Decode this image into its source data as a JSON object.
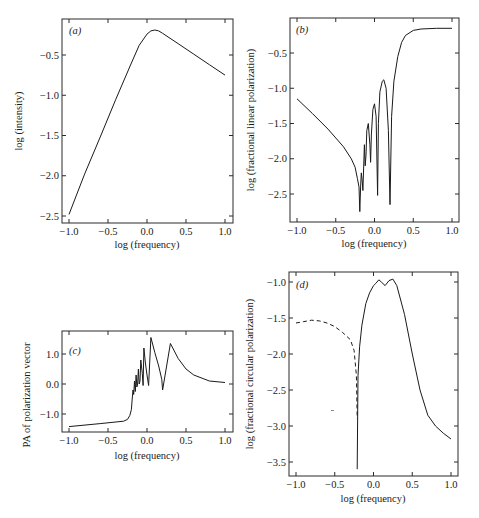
{
  "chart_data": [
    {
      "panel": "a",
      "type": "line",
      "label": "(a)",
      "title": "",
      "xlabel": "log (frequency)",
      "ylabel": "log (intensity)",
      "xlim": [
        -1.0,
        1.0
      ],
      "ylim": [
        -2.6,
        -0.15
      ],
      "xticks": [
        "-1.0",
        "-0.5",
        "0.0",
        "0.5",
        "1.0"
      ],
      "yticks": [
        "-0.5",
        "-1.0",
        "-1.5",
        "-2.0",
        "-2.5"
      ],
      "grid": false,
      "series": [
        {
          "name": "intensity",
          "style": "solid",
          "x": [
            -1.0,
            -0.8,
            -0.6,
            -0.4,
            -0.2,
            -0.1,
            0.0,
            0.05,
            0.1,
            0.15,
            0.2,
            0.4,
            0.6,
            0.8,
            1.0
          ],
          "y": [
            -2.48,
            -1.98,
            -1.52,
            -1.05,
            -0.6,
            -0.38,
            -0.24,
            -0.2,
            -0.19,
            -0.2,
            -0.23,
            -0.36,
            -0.49,
            -0.62,
            -0.75
          ]
        }
      ]
    },
    {
      "panel": "b",
      "type": "line",
      "label": "(b)",
      "title": "",
      "xlabel": "log (frequency)",
      "ylabel": "log (fractional linear polarization)",
      "xlim": [
        -1.0,
        1.0
      ],
      "ylim": [
        -2.85,
        -0.1
      ],
      "xticks": [
        "-1.0",
        "-0.5",
        "0.0",
        "0.5",
        "1.0"
      ],
      "yticks": [
        "-0.5",
        "-1.0",
        "-1.5",
        "-2.0",
        "-2.5"
      ],
      "grid": false,
      "series": [
        {
          "name": "linear polarization",
          "style": "solid",
          "x": [
            -1.0,
            -0.8,
            -0.6,
            -0.4,
            -0.3,
            -0.25,
            -0.22,
            -0.2,
            -0.19,
            -0.18,
            -0.17,
            -0.16,
            -0.15,
            -0.13,
            -0.12,
            -0.11,
            -0.1,
            -0.08,
            -0.06,
            -0.05,
            -0.04,
            -0.02,
            0.0,
            0.02,
            0.04,
            0.05,
            0.07,
            0.1,
            0.12,
            0.15,
            0.18,
            0.2,
            0.22,
            0.25,
            0.3,
            0.35,
            0.4,
            0.5,
            0.6,
            0.8,
            1.0
          ],
          "y": [
            -1.15,
            -1.36,
            -1.58,
            -1.83,
            -2.0,
            -2.12,
            -2.28,
            -2.4,
            -2.75,
            -2.4,
            -2.2,
            -2.3,
            -2.45,
            -1.8,
            -2.1,
            -1.95,
            -1.6,
            -1.5,
            -1.8,
            -2.05,
            -1.65,
            -1.3,
            -1.22,
            -1.4,
            -2.52,
            -1.5,
            -1.05,
            -0.9,
            -0.88,
            -1.0,
            -1.6,
            -2.65,
            -1.4,
            -0.9,
            -0.55,
            -0.35,
            -0.25,
            -0.18,
            -0.16,
            -0.15,
            -0.15
          ]
        }
      ]
    },
    {
      "panel": "c",
      "type": "line",
      "label": "(c)",
      "title": "",
      "xlabel": "log (frequency)",
      "ylabel": "PA of polarization vector",
      "xlim": [
        -1.0,
        1.0
      ],
      "ylim": [
        -1.55,
        1.75
      ],
      "xticks": [
        "-1.0",
        "-0.5",
        "0.0",
        "0.5",
        "1.0"
      ],
      "yticks": [
        "1.0",
        "0.0",
        "-1.0"
      ],
      "grid": false,
      "series": [
        {
          "name": "position angle",
          "style": "solid",
          "x": [
            -1.0,
            -0.6,
            -0.3,
            -0.25,
            -0.22,
            -0.2,
            -0.19,
            -0.18,
            -0.17,
            -0.16,
            -0.15,
            -0.14,
            -0.13,
            -0.12,
            -0.11,
            -0.1,
            -0.09,
            -0.08,
            -0.06,
            -0.05,
            -0.04,
            -0.02,
            0.0,
            0.02,
            0.05,
            0.1,
            0.15,
            0.19,
            0.2,
            0.3,
            0.4,
            0.5,
            0.6,
            0.8,
            1.0
          ],
          "y": [
            -1.42,
            -1.32,
            -1.24,
            -1.18,
            -1.05,
            -0.85,
            -0.5,
            -0.2,
            -0.35,
            0.1,
            -0.25,
            0.3,
            -0.1,
            0.0,
            0.5,
            0.0,
            0.1,
            0.8,
            0.35,
            -0.05,
            1.2,
            0.7,
            0.3,
            -0.05,
            1.55,
            1.05,
            0.6,
            0.15,
            -0.2,
            1.35,
            0.85,
            0.5,
            0.3,
            0.1,
            0.05
          ]
        }
      ]
    },
    {
      "panel": "d",
      "type": "line",
      "label": "(d)",
      "title": "",
      "xlabel": "log (frequency)",
      "ylabel": "log (fractional circular polarization)",
      "xlim": [
        -1.0,
        1.0
      ],
      "ylim": [
        -3.6,
        -0.85
      ],
      "xticks": [
        "-1.0",
        "-0.5",
        "0.0",
        "0.5",
        "1.0"
      ],
      "yticks": [
        "-1.0",
        "-1.5",
        "-2.0",
        "-2.5",
        "-3.0",
        "-3.5"
      ],
      "grid": false,
      "series": [
        {
          "name": "negative (dashed)",
          "style": "dashed",
          "x": [
            -1.0,
            -0.9,
            -0.8,
            -0.7,
            -0.6,
            -0.5,
            -0.4,
            -0.3,
            -0.25,
            -0.22,
            -0.21
          ],
          "y": [
            -1.57,
            -1.55,
            -1.53,
            -1.54,
            -1.57,
            -1.62,
            -1.7,
            -1.8,
            -1.95,
            -2.3,
            -2.9
          ]
        },
        {
          "name": "positive (solid)",
          "style": "solid",
          "x": [
            -0.21,
            -0.2,
            -0.18,
            -0.15,
            -0.1,
            -0.05,
            0.0,
            0.03,
            0.07,
            0.1,
            0.15,
            0.2,
            0.25,
            0.3,
            0.4,
            0.5,
            0.6,
            0.7,
            0.8,
            0.9,
            1.0
          ],
          "y": [
            -3.6,
            -2.3,
            -1.9,
            -1.6,
            -1.3,
            -1.15,
            -1.05,
            -1.02,
            -0.97,
            -1.0,
            -1.05,
            -0.98,
            -0.96,
            -1.05,
            -1.45,
            -2.0,
            -2.5,
            -2.85,
            -3.0,
            -3.1,
            -3.18
          ]
        }
      ]
    }
  ]
}
